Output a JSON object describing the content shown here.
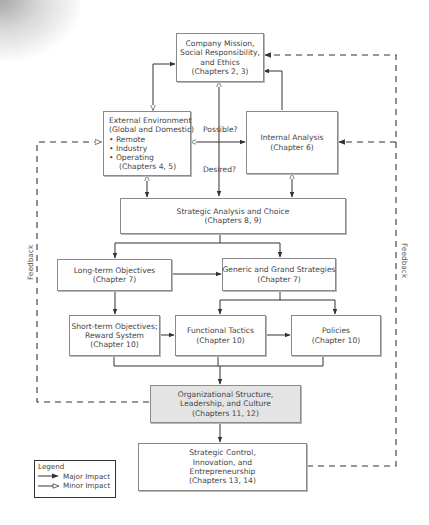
{
  "diagram": {
    "nodes": {
      "mission": {
        "lines": [
          "Company Mission,",
          "Social Responsibility,",
          "and Ethics",
          "(Chapters 2, 3)"
        ]
      },
      "external": {
        "lines": [
          "External Environment",
          "(Global and Domestic)",
          "• Remote",
          "• Industry",
          "• Operating",
          "   (Chapters 4, 5)"
        ]
      },
      "internal": {
        "lines": [
          "Internal Analysis",
          "(Chapter 6)"
        ]
      },
      "strategic_analysis": {
        "lines": [
          "Strategic Analysis and Choice",
          "(Chapters 8, 9)"
        ]
      },
      "long_term": {
        "lines": [
          "Long-term Objectives",
          "(Chapter 7)"
        ]
      },
      "generic_grand": {
        "lines": [
          "Generic and Grand Strategies",
          "(Chapter 7)"
        ]
      },
      "short_term": {
        "lines": [
          "Short-term Objectives;",
          "Reward System",
          "(Chapter 10)"
        ]
      },
      "functional": {
        "lines": [
          "Functional Tactics",
          "(Chapter 10)"
        ]
      },
      "policies": {
        "lines": [
          "Policies",
          "(Chapter 10)"
        ]
      },
      "org_structure": {
        "lines": [
          "Organizational Structure,",
          "Leadership, and Culture",
          "(Chapters 11, 12)"
        ]
      },
      "strategic_control": {
        "lines": [
          "Strategic Control,",
          "Innovation, and",
          "Entrepreneurship",
          "(Chapters 13, 14)"
        ]
      }
    },
    "edge_labels": {
      "possible": "Possible?",
      "desired": "Desired?",
      "feedback_left": "Feedback",
      "feedback_right": "Feedback"
    },
    "legend": {
      "title": "Legend",
      "major": "Major Impact",
      "minor": "Minor Impact"
    },
    "colors": {
      "line": "#333333",
      "box_border": "#8a8a8a",
      "shaded_box": "#e4e4e4"
    }
  }
}
